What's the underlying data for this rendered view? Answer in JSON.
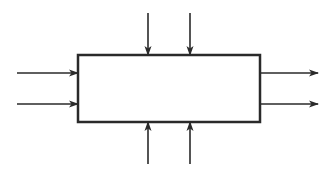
{
  "diagram": {
    "type": "block-diagram",
    "colors": {
      "stroke": "#2a2a2a",
      "background": "#ffffff",
      "box_fill": "#ffffff"
    },
    "box": {
      "x": 78,
      "y": 55,
      "width": 182,
      "height": 67,
      "label": ""
    },
    "arrows": {
      "left_inputs": [
        {
          "x1": 17,
          "y1": 73,
          "x2": 78,
          "y2": 73
        },
        {
          "x1": 17,
          "y1": 104,
          "x2": 78,
          "y2": 104
        }
      ],
      "top_inputs": [
        {
          "x1": 148,
          "y1": 13,
          "x2": 148,
          "y2": 55
        },
        {
          "x1": 190,
          "y1": 13,
          "x2": 190,
          "y2": 55
        }
      ],
      "bottom_inputs": [
        {
          "x1": 148,
          "y1": 164,
          "x2": 148,
          "y2": 122
        },
        {
          "x1": 190,
          "y1": 164,
          "x2": 190,
          "y2": 122
        }
      ],
      "right_outputs": [
        {
          "x1": 260,
          "y1": 73,
          "x2": 318,
          "y2": 73
        },
        {
          "x1": 260,
          "y1": 104,
          "x2": 318,
          "y2": 104
        }
      ]
    }
  }
}
